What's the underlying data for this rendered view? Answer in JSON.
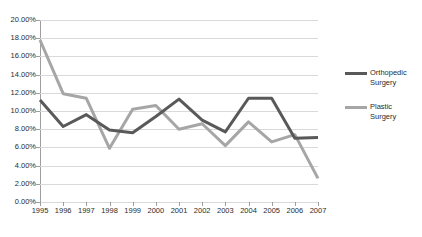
{
  "chart_data": {
    "type": "line",
    "title": "",
    "xlabel": "",
    "ylabel": "",
    "categories": [
      "1995",
      "1996",
      "1997",
      "1998",
      "1999",
      "2000",
      "2001",
      "2002",
      "2003",
      "2004",
      "2005",
      "2006",
      "2007"
    ],
    "ylim": [
      0,
      20
    ],
    "ytick_values": [
      0,
      2,
      4,
      6,
      8,
      10,
      12,
      14,
      16,
      18,
      20
    ],
    "ytick_labels": [
      "0.00%",
      "2.00%",
      "4.00%",
      "6.00%",
      "8.00%",
      "10.00%",
      "12.00%",
      "14.00%",
      "16.00%",
      "18.00%",
      "20.00%"
    ],
    "grid": true,
    "legend_position": "right",
    "series": [
      {
        "name": "Orthopedic Surgery",
        "color": "#595959",
        "values": [
          11.2,
          8.3,
          9.6,
          7.9,
          7.6,
          9.4,
          11.3,
          9.0,
          7.7,
          11.4,
          11.4,
          7.0,
          7.1
        ]
      },
      {
        "name": "Plastic Surgery",
        "color": "#a6a6a6",
        "values": [
          17.8,
          11.9,
          11.4,
          5.9,
          10.2,
          10.6,
          8.0,
          8.6,
          6.2,
          8.8,
          6.6,
          7.4,
          2.6
        ]
      }
    ]
  },
  "legend": {
    "entries": [
      {
        "label_line1": "Orthopedic",
        "label_line2": "Surgery"
      },
      {
        "label_line1": "Plastic",
        "label_line2": "Surgery"
      }
    ]
  },
  "colors": {
    "orthopedic": "#595959",
    "plastic": "#a6a6a6",
    "gridline": "#d9d9d9",
    "axis": "#9e9e9e",
    "text": "#2b2b2b",
    "background": "#ffffff"
  }
}
